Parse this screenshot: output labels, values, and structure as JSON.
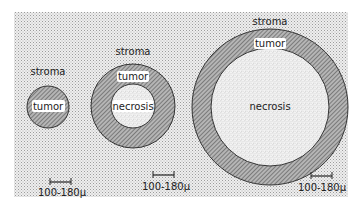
{
  "figure": {
    "panels": [
      {
        "id": "small",
        "labels": {
          "outer": "stroma",
          "ring": "tumor"
        },
        "scale_label": "100-180μ"
      },
      {
        "id": "medium",
        "labels": {
          "outer": "stroma",
          "ring": "tumor",
          "core": "necrosis"
        },
        "scale_label": "100-180μ"
      },
      {
        "id": "large",
        "labels": {
          "outer": "stroma",
          "ring": "tumor",
          "core": "necrosis"
        },
        "scale_label": "100-180μ"
      }
    ]
  },
  "colors": {
    "stroma_bg": "#e6e6e6",
    "tumor_fill": "#9a9a9a",
    "necrosis_fill": "#ececec",
    "outline": "#333333"
  }
}
